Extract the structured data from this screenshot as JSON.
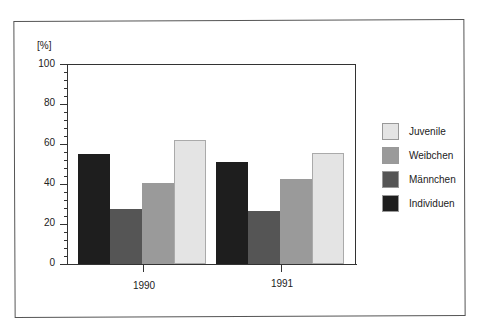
{
  "chart_data": {
    "type": "bar",
    "title": "",
    "xlabel": "",
    "ylabel": "[%]",
    "ylim": [
      0,
      100
    ],
    "yticks": [
      0,
      20,
      40,
      60,
      80,
      100
    ],
    "ytick_labels": [
      "0",
      "20",
      "40",
      "60",
      "80",
      "100"
    ],
    "minor_tick_step": 4,
    "grid": false,
    "legend_position": "right",
    "categories": [
      "1990",
      "1991"
    ],
    "series": [
      {
        "name": "Individuen",
        "color": "#1e1e1e",
        "values": [
          55,
          51
        ]
      },
      {
        "name": "Männchen",
        "color": "#555555",
        "values": [
          27.5,
          26.5
        ]
      },
      {
        "name": "Weibchen",
        "color": "#9a9a9a",
        "values": [
          40.5,
          42.5
        ]
      },
      {
        "name": "Juvenile",
        "color": "#e4e4e4",
        "values": [
          62,
          55.5
        ]
      }
    ],
    "legend_order": [
      "Juvenile",
      "Weibchen",
      "Männchen",
      "Individuen"
    ]
  },
  "labels": {
    "unit": "[%]",
    "y": [
      "0",
      "20",
      "40",
      "60",
      "80",
      "100"
    ],
    "x": [
      "1990",
      "1991"
    ],
    "legend": [
      "Juvenile",
      "Weibchen",
      "Männchen",
      "Individuen"
    ]
  }
}
